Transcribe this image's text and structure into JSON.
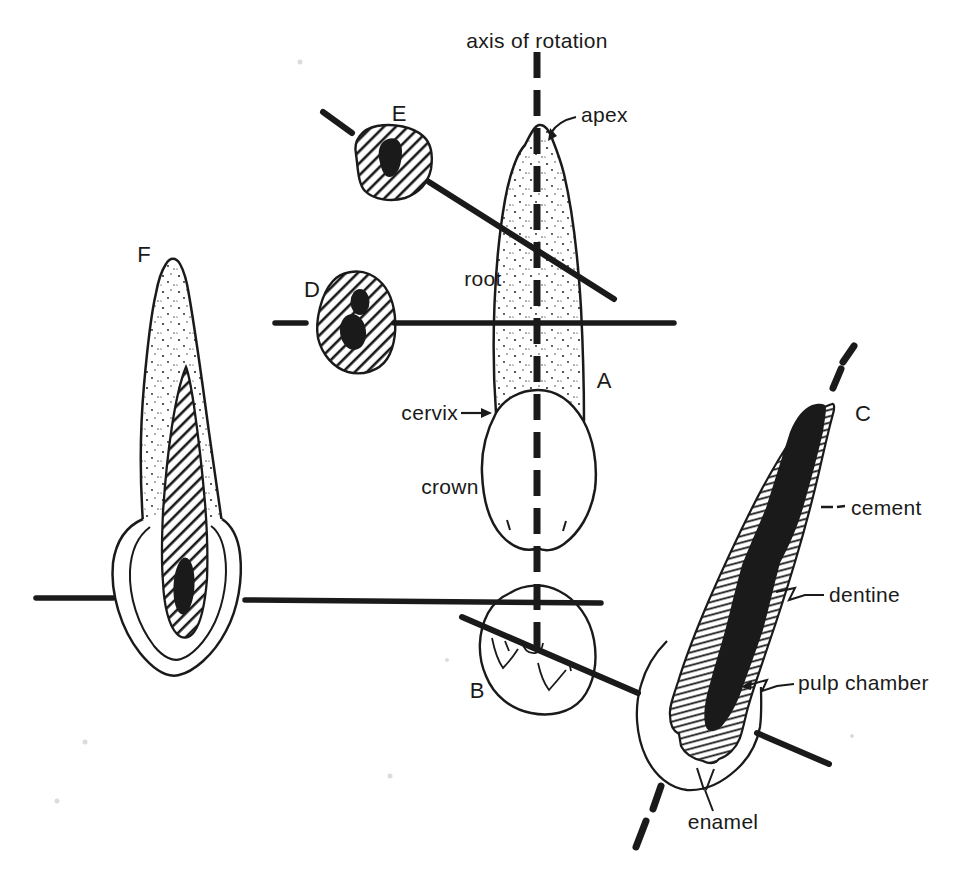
{
  "figure": {
    "colors": {
      "ink": "#1a1a1a",
      "background": "#ffffff"
    },
    "labels": {
      "axis_of_rotation": "axis of rotation",
      "apex": "apex",
      "root": "root",
      "cervix": "cervix",
      "crown": "crown",
      "cement": "cement",
      "dentine": "dentine",
      "pulp_chamber": "pulp chamber",
      "enamel": "enamel"
    },
    "views": {
      "a": "A",
      "b": "B",
      "c": "C",
      "d": "D",
      "e": "E",
      "f": "F"
    }
  }
}
